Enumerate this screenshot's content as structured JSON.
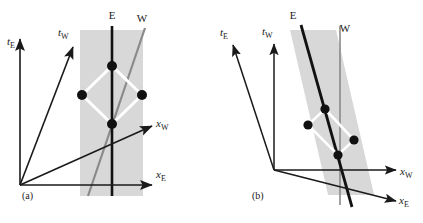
{
  "figure": {
    "type": "spacetime-diagram-pair",
    "width": 423,
    "height": 223,
    "background": "#ffffff",
    "colors": {
      "axis": "#1a1a1a",
      "worldline_E": "#111111",
      "worldline_W": "#8a8a8a",
      "band": "#d8d8d8",
      "diamond": "#ffffff",
      "event_dot": "#111111",
      "text": "#1a1a1a"
    }
  },
  "panels": [
    {
      "id": "a",
      "label": "(a)",
      "label_pos": [
        22,
        199
      ],
      "origin": [
        20,
        185
      ],
      "axes": [
        {
          "name": "t_E",
          "base": "t",
          "sub": "E",
          "from": [
            20,
            185
          ],
          "to": [
            20,
            39
          ],
          "label_pos": [
            7,
            45
          ]
        },
        {
          "name": "t_W",
          "base": "t",
          "sub": "W",
          "from": [
            20,
            185
          ],
          "to": [
            73,
            47
          ],
          "label_pos": [
            58,
            36
          ]
        },
        {
          "name": "x_E",
          "base": "x",
          "sub": "E",
          "from": [
            20,
            185
          ],
          "to": [
            152,
            185
          ],
          "label_pos": [
            156,
            178
          ]
        },
        {
          "name": "x_W",
          "base": "x",
          "sub": "W",
          "from": [
            20,
            185
          ],
          "to": [
            152,
            126
          ],
          "label_pos": [
            156,
            127
          ]
        }
      ],
      "band": {
        "x": 80,
        "y": 30,
        "width": 63,
        "height": 166,
        "skew_deg": 0
      },
      "worldlines": [
        {
          "name": "E",
          "label": "E",
          "label_pos": [
            112,
            19
          ],
          "from": [
            112,
            26
          ],
          "to": [
            112,
            196
          ],
          "color": "#111111",
          "width": 2.6
        },
        {
          "name": "W",
          "label": "W",
          "label_pos": [
            142,
            22
          ],
          "from": [
            145,
            28
          ],
          "to": [
            88,
            196
          ],
          "color": "#8a8a8a",
          "width": 2.2
        }
      ],
      "events": [
        {
          "name": "top",
          "pos": [
            112,
            66
          ]
        },
        {
          "name": "left",
          "pos": [
            82,
            95
          ]
        },
        {
          "name": "right",
          "pos": [
            142,
            95
          ]
        },
        {
          "name": "bottom",
          "pos": [
            112,
            124
          ]
        }
      ],
      "light_paths": "diamond connecting bottom-left-top-right in white"
    },
    {
      "id": "b",
      "label": "(b)",
      "label_pos": [
        252,
        199
      ],
      "origin": [
        274,
        170
      ],
      "axes": [
        {
          "name": "t_E",
          "base": "t",
          "sub": "E",
          "from": [
            274,
            170
          ],
          "to": [
            233,
            45
          ],
          "label_pos": [
            220,
            36
          ]
        },
        {
          "name": "t_W",
          "base": "t",
          "sub": "W",
          "from": [
            274,
            170
          ],
          "to": [
            274,
            44
          ],
          "label_pos": [
            262,
            35
          ]
        },
        {
          "name": "x_W",
          "base": "x",
          "sub": "W",
          "from": [
            274,
            170
          ],
          "to": [
            396,
            170
          ],
          "label_pos": [
            400,
            175
          ]
        },
        {
          "name": "x_E",
          "base": "x",
          "sub": "E",
          "from": [
            274,
            170
          ],
          "to": [
            396,
            201
          ],
          "label_pos": [
            399,
            204
          ]
        }
      ],
      "band": {
        "x": 290,
        "y": 30,
        "width": 46,
        "height": 165,
        "skew_deg": -13
      },
      "worldlines": [
        {
          "name": "E",
          "label": "E",
          "label_pos": [
            293,
            19
          ],
          "from": [
            301,
            25
          ],
          "to": [
            352,
            207
          ],
          "color": "#111111",
          "width": 2.8
        },
        {
          "name": "W",
          "label": "W",
          "label_pos": [
            345,
            32
          ],
          "from": [
            340,
            26
          ],
          "to": [
            340,
            205
          ],
          "color": "#8a8a8a",
          "width": 1.6
        }
      ],
      "events": [
        {
          "name": "top",
          "pos": [
            325,
            109
          ]
        },
        {
          "name": "left",
          "pos": [
            308,
            125
          ]
        },
        {
          "name": "right",
          "pos": [
            354,
            140
          ]
        },
        {
          "name": "bottom",
          "pos": [
            338,
            155
          ]
        }
      ],
      "light_paths": "skewed diamond connecting bottom-left-top-right in white"
    }
  ]
}
